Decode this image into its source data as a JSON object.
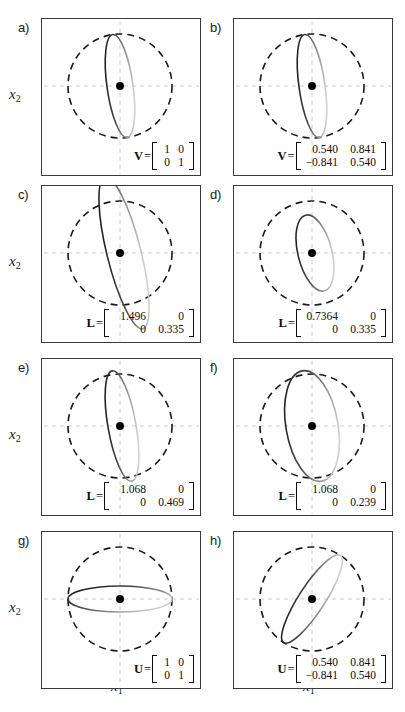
{
  "figure": {
    "axis_labels": {
      "x": "x",
      "x_sub": "1",
      "y": "x",
      "y_sub": "2"
    },
    "colors": {
      "panel_border": "#3a3a3a",
      "grid_dashed": "#cccccc",
      "circle_dashed": "#1a1a1a",
      "ellipse_dark": "#111111",
      "ellipse_light": "#cfcfcf",
      "center_dot": "#000000",
      "background": "#ffffff"
    }
  },
  "panels": [
    {
      "letter": "a)",
      "matrix": {
        "name": "V",
        "eq": "=",
        "cells": [
          "1",
          "0",
          "0",
          "1"
        ],
        "width": "narrow"
      },
      "geometry": {
        "circle_r": 52,
        "ellipse_rx": 13,
        "ellipse_ry": 52,
        "ellipse_rotation": -8,
        "ellipse_cx_offset": 0,
        "ellipse_cy_offset": 0
      },
      "has_y_label": true,
      "has_x_label": false
    },
    {
      "letter": "b)",
      "matrix": {
        "name": "V",
        "eq": "=",
        "cells": [
          "0.540",
          "0.841",
          "−0.841",
          "0.540"
        ],
        "width": "wide"
      },
      "geometry": {
        "circle_r": 52,
        "ellipse_rx": 13,
        "ellipse_ry": 52,
        "ellipse_rotation": -8,
        "ellipse_cx_offset": 0,
        "ellipse_cy_offset": 0
      },
      "has_y_label": false,
      "has_x_label": false
    },
    {
      "letter": "c)",
      "matrix": {
        "name": "L",
        "eq": "=",
        "cells": [
          "1.496",
          "0",
          "0",
          "0.335"
        ],
        "width": "wide"
      },
      "geometry": {
        "circle_r": 52,
        "ellipse_rx": 17,
        "ellipse_ry": 78,
        "ellipse_rotation": -14,
        "ellipse_cx_offset": 4,
        "ellipse_cy_offset": 0
      },
      "has_y_label": true,
      "has_x_label": false
    },
    {
      "letter": "d)",
      "matrix": {
        "name": "L",
        "eq": "=",
        "cells": [
          "0.7364",
          "0",
          "0",
          "0.335"
        ],
        "width": "wide"
      },
      "geometry": {
        "circle_r": 52,
        "ellipse_rx": 17,
        "ellipse_ry": 39,
        "ellipse_rotation": -14,
        "ellipse_cx_offset": 3,
        "ellipse_cy_offset": 0
      },
      "has_y_label": false,
      "has_x_label": false
    },
    {
      "letter": "e)",
      "matrix": {
        "name": "L",
        "eq": "=",
        "cells": [
          "1.068",
          "0",
          "0",
          "0.469"
        ],
        "width": "wide"
      },
      "geometry": {
        "circle_r": 52,
        "ellipse_rx": 14,
        "ellipse_ry": 56,
        "ellipse_rotation": -10,
        "ellipse_cx_offset": 2,
        "ellipse_cy_offset": 0
      },
      "has_y_label": true,
      "has_x_label": false
    },
    {
      "letter": "f)",
      "matrix": {
        "name": "L",
        "eq": "=",
        "cells": [
          "1.068",
          "0",
          "0",
          "0.239"
        ],
        "width": "wide"
      },
      "geometry": {
        "circle_r": 52,
        "ellipse_rx": 26,
        "ellipse_ry": 56,
        "ellipse_rotation": -10,
        "ellipse_cx_offset": 0,
        "ellipse_cy_offset": 0
      },
      "has_y_label": false,
      "has_x_label": false
    },
    {
      "letter": "g)",
      "matrix": {
        "name": "U",
        "eq": "=",
        "cells": [
          "1",
          "0",
          "0",
          "1"
        ],
        "width": "narrow"
      },
      "geometry": {
        "circle_r": 52,
        "ellipse_rx": 52,
        "ellipse_ry": 13,
        "ellipse_rotation": 0,
        "ellipse_cx_offset": 0,
        "ellipse_cy_offset": 0
      },
      "has_y_label": true,
      "has_x_label": true
    },
    {
      "letter": "h)",
      "matrix": {
        "name": "U",
        "eq": "=",
        "cells": [
          "0.540",
          "0.841",
          "−0.841",
          "0.540"
        ],
        "width": "wide"
      },
      "geometry": {
        "circle_r": 52,
        "ellipse_rx": 52,
        "ellipse_ry": 13,
        "ellipse_rotation": -57,
        "ellipse_cx_offset": 0,
        "ellipse_cy_offset": 0
      },
      "has_y_label": false,
      "has_x_label": true
    }
  ],
  "layout": {
    "panel_w": 160,
    "panel_h": 158,
    "col_x": [
      41,
      233
    ],
    "row_y": [
      18,
      185,
      358,
      531
    ],
    "letter_x": [
      18,
      210
    ],
    "ylabel_x": 9,
    "xlabel_y": 678
  }
}
